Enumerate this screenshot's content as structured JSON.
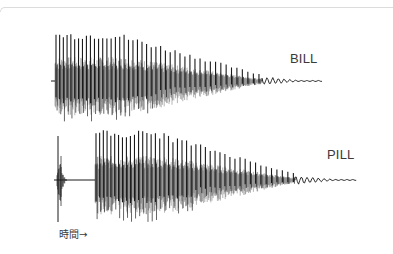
{
  "figure": {
    "type": "speech waveform comparison",
    "waveforms": [
      {
        "label": "BILL",
        "baseline_y": 81,
        "burst": null,
        "voicing_start_x": 55,
        "decay_end_x": 262,
        "tail_end_x": 322,
        "peak_top_y": 32,
        "peak_bottom_y": 122,
        "color": "#1a1a1a"
      },
      {
        "label": "PILL",
        "baseline_y": 180,
        "burst": {
          "start_x": 57,
          "end_x": 65,
          "top_y": 136,
          "bottom_y": 222
        },
        "silent_gap": {
          "start_x": 65,
          "end_x": 95
        },
        "voicing_start_x": 95,
        "decay_end_x": 295,
        "tail_end_x": 357,
        "peak_top_y": 130,
        "peak_bottom_y": 222,
        "color": "#1a1a1a"
      }
    ],
    "time_axis_label": "時間→",
    "frame_color": "#dcdcdc"
  }
}
